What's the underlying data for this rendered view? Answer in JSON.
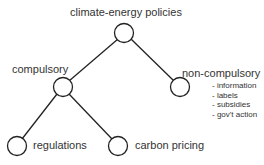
{
  "diagram": {
    "type": "tree",
    "root": {
      "label": "climate-energy policies"
    },
    "nodes": [
      {
        "id": "root",
        "label": "climate-energy policies"
      },
      {
        "id": "compulsory",
        "label": "compulsory",
        "parent": "root"
      },
      {
        "id": "non_compulsory",
        "label": "non-compulsory",
        "parent": "root",
        "items": [
          "- information",
          "- labels",
          "- subsidies",
          "- gov't action"
        ]
      },
      {
        "id": "regulations",
        "label": "regulations",
        "parent": "compulsory"
      },
      {
        "id": "carbon_pricing",
        "label": "carbon pricing",
        "parent": "compulsory"
      }
    ]
  },
  "labels": {
    "root": "climate-energy policies",
    "compulsory": "compulsory",
    "non_compulsory": "non-compulsory",
    "regulations": "regulations",
    "carbon_pricing": "carbon pricing",
    "non_compulsory_items": [
      "- information",
      "- labels",
      "- subsidies",
      "- gov't action"
    ]
  }
}
